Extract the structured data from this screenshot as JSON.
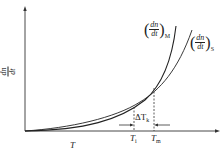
{
  "diagram": {
    "y_axis_label_num": "dn",
    "y_axis_label_den": "dt",
    "x_axis_label": "T",
    "curve_m": {
      "num": "dn",
      "den": "dt",
      "subscript": "M"
    },
    "curve_s": {
      "num": "dn",
      "den": "dt",
      "subscript": "S"
    },
    "delta_label": "ΔT",
    "delta_subscript": "k",
    "ti_label": "T",
    "ti_subscript": "i",
    "tm_label": "T",
    "tm_subscript": "m",
    "colors": {
      "line": "#222222",
      "axis": "#333333"
    }
  }
}
